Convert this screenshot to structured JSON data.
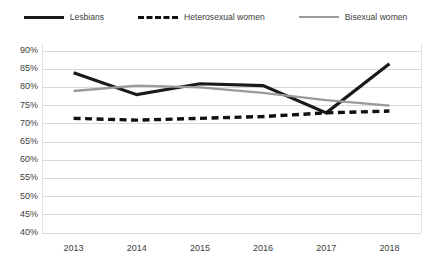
{
  "legend": {
    "position": "top-center",
    "items": [
      {
        "label": "Lesbians",
        "style": "solid",
        "color": "#1a1a1a",
        "icon": "line-swatch-icon"
      },
      {
        "label": "Heterosexual women",
        "style": "dashed",
        "color": "#111111",
        "icon": "dashed-line-swatch-icon"
      },
      {
        "label": "Bisexual women",
        "style": "solid",
        "color": "#9a9a9a",
        "icon": "line-swatch-icon"
      }
    ]
  },
  "axes": {
    "y_ticks": [
      "90%",
      "85%",
      "80%",
      "75%",
      "70%",
      "65%",
      "60%",
      "55%",
      "50%",
      "45%",
      "40%"
    ],
    "x_ticks": [
      "2013",
      "2014",
      "2015",
      "2016",
      "2017",
      "2018"
    ]
  },
  "colors": {
    "lesbians": "#1a1a1a",
    "heterosexual_women": "#111111",
    "bisexual_women": "#9a9a9a",
    "gridline": "#d9d9d9",
    "axis_text": "#3d3d3d",
    "background": "#ffffff"
  },
  "chart_data": {
    "type": "line",
    "title": "",
    "subtitle": "",
    "xlabel": "",
    "ylabel": "",
    "x": [
      "2013",
      "2014",
      "2015",
      "2016",
      "2017",
      "2018"
    ],
    "categories": [
      "2013",
      "2014",
      "2015",
      "2016",
      "2017",
      "2018"
    ],
    "ylim": [
      40,
      90
    ],
    "ytick_values": [
      90,
      85,
      80,
      75,
      70,
      65,
      60,
      55,
      50,
      45,
      40
    ],
    "ytick_labels": [
      "90%",
      "85%",
      "80%",
      "75%",
      "70%",
      "65%",
      "60%",
      "55%",
      "50%",
      "45%",
      "40%"
    ],
    "y_unit": "%",
    "grid": "horizontal",
    "legend_position": "top",
    "series": [
      {
        "name": "Lesbians",
        "color": "#1a1a1a",
        "style": "solid",
        "values": [
          84,
          78,
          81,
          80.5,
          73,
          86.5
        ]
      },
      {
        "name": "Heterosexual women",
        "color": "#111111",
        "style": "dashed",
        "values": [
          71.5,
          71,
          71.5,
          72,
          73,
          73.5
        ]
      },
      {
        "name": "Bisexual women",
        "color": "#9a9a9a",
        "style": "solid",
        "values": [
          79,
          80.5,
          80,
          78.5,
          76.5,
          75
        ]
      }
    ],
    "annotations": []
  }
}
